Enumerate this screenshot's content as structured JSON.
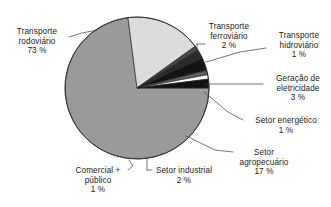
{
  "chart_data": {
    "type": "pie",
    "title": "",
    "subtitle": "",
    "xlabel": "",
    "ylabel": "",
    "legend_position": "none",
    "grid": false,
    "value_unit": "%",
    "start_angle_deg": 0,
    "direction": "clockwise",
    "categories": [
      "Transporte rodoviário",
      "Setor agropecuário",
      "Comercial + público",
      "Setor industrial",
      "Geração de eletricidade",
      "Setor energético",
      "Transporte hidroviário",
      "Transporte ferroviário"
    ],
    "values": [
      73,
      17,
      1,
      2,
      3,
      1,
      1,
      2
    ],
    "slices": [
      {
        "label": "Transporte rodoviário",
        "value": 73,
        "value_text": "73 %",
        "color": "#9a9a9a"
      },
      {
        "label": "Setor agropecuário",
        "value": 17,
        "value_text": "17 %",
        "color": "#dcdcdc"
      },
      {
        "label": "Comercial + público",
        "value": 1,
        "value_text": "1 %",
        "color": "#4a4a4a"
      },
      {
        "label": "Setor industrial",
        "value": 2,
        "value_text": "2 %",
        "color": "#2b2b2b"
      },
      {
        "label": "Geração de eletricidade",
        "value": 3,
        "value_text": "3 %",
        "color": "#141414"
      },
      {
        "label": "Setor energético",
        "value": 1,
        "value_text": "1 %",
        "color": "#5e5e5e"
      },
      {
        "label": "Transporte hidroviário",
        "value": 1,
        "value_text": "1 %",
        "color": "#ffffff"
      },
      {
        "label": "Transporte ferroviário",
        "value": 2,
        "value_text": "2 %",
        "color": "#111111"
      }
    ]
  },
  "labels": {
    "rodoviario": {
      "line1": "Transporte",
      "line2": "rodoviário",
      "pct": "73 %"
    },
    "ferroviario": {
      "line1": "Transporte",
      "line2": "ferroviário",
      "pct": "2 %"
    },
    "hidroviario": {
      "line1": "Transporte",
      "line2": "hidroviário",
      "pct": "1 %"
    },
    "eletricidade": {
      "line1": "Geração de",
      "line2": "eletricidade",
      "pct": "3 %"
    },
    "energetico": {
      "line1": "Setor energético",
      "line2": "",
      "pct": "1 %"
    },
    "agropecuario": {
      "line1": "Setor",
      "line2": "agropecuário",
      "pct": "17 %"
    },
    "industrial": {
      "line1": "Setor industrial",
      "line2": "",
      "pct": "2 %"
    },
    "comercial": {
      "line1": "Comercial +",
      "line2": "público",
      "pct": "1 %"
    }
  },
  "colors": {
    "background": "#ffffff",
    "text": "#1a1a1a",
    "outline": "#2a2a2a",
    "leader": "#3c3c3c"
  }
}
